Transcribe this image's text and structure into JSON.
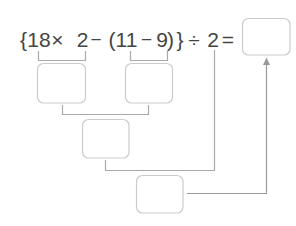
{
  "expression": {
    "tokens": [
      "{",
      "18",
      "×",
      "2",
      "−",
      "(",
      "11",
      "−",
      "9",
      ")",
      "}",
      "÷",
      "2",
      "="
    ],
    "text": "{18 × 2 − (11 − 9)} ÷ 2 ="
  },
  "boxes": {
    "step_18x2": {
      "value": ""
    },
    "step_11minus9": {
      "value": ""
    },
    "step_subtract": {
      "value": ""
    },
    "step_divide": {
      "value": ""
    },
    "final_answer": {
      "value": ""
    }
  },
  "colors": {
    "text": "#444444",
    "bracket_line": "#aaaaaa",
    "arrow": "#999999",
    "box_border": "#cccccc",
    "background": "#ffffff"
  }
}
